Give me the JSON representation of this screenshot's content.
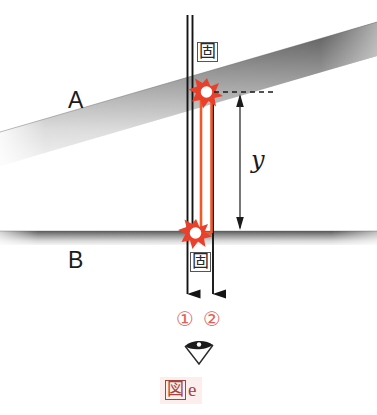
{
  "figure": {
    "caption_box_char": "図",
    "caption_letter": "e",
    "background_color": "#ffffff",
    "caption_color": "#a4453c",
    "caption_background": "#fbeeed"
  },
  "media": {
    "upper": {
      "label": "A",
      "name": "medium-a-band",
      "orientation": "tilted"
    },
    "lower": {
      "label": "B",
      "name": "medium-b-band",
      "orientation": "horizontal"
    }
  },
  "annotations": {
    "fixed_upper": "固",
    "fixed_lower": "固",
    "distance_label": "y"
  },
  "rays": [
    {
      "id": "1",
      "label": "①",
      "color": "#1b1b1b"
    },
    {
      "id": "2",
      "label": "②",
      "color": "#1b1b1b"
    }
  ],
  "colors": {
    "ray_path": "#f05a28",
    "marker_stroke": "#e8402a",
    "line_black": "#141414",
    "band_dark": "#3a3a3a",
    "ray_number": "#e0615a"
  },
  "observer": {
    "icon": "eye-icon",
    "direction": "up"
  }
}
